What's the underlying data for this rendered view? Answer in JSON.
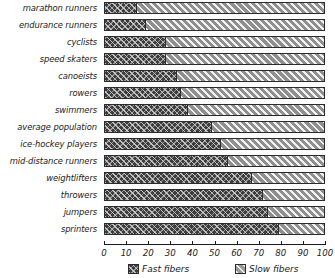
{
  "chart_data": {
    "type": "bar",
    "orientation": "horizontal",
    "stacked": true,
    "percent_stacked": true,
    "title": "",
    "xlabel": "",
    "ylabel": "",
    "xlim": [
      0,
      100
    ],
    "xticks": [
      0,
      10,
      20,
      30,
      40,
      50,
      60,
      70,
      80,
      90,
      100
    ],
    "xtick_labels": [
      "0",
      "10",
      "20",
      "30",
      "40",
      "50",
      "60",
      "70",
      "80",
      "90",
      "100"
    ],
    "grid": false,
    "legend_position": "bottom",
    "categories": [
      "marathon runners",
      "endurance runners",
      "cyclists",
      "speed skaters",
      "canoeists",
      "rowers",
      "swimmers",
      "average population",
      "ice-hockey players",
      "mid-distance runners",
      "weightlifters",
      "throwers",
      "jumpers",
      "sprinters"
    ],
    "series": [
      {
        "name": "Fast fibers",
        "values": [
          15,
          19,
          28,
          28,
          33,
          35,
          38,
          49,
          53,
          56,
          67,
          72,
          74,
          79
        ]
      },
      {
        "name": "Slow fibers",
        "values": [
          85,
          81,
          72,
          72,
          67,
          65,
          62,
          51,
          47,
          44,
          33,
          28,
          26,
          21
        ]
      }
    ],
    "legend": [
      {
        "label": "Fast fibers",
        "pattern": "dark-crosshatch",
        "color": "#3d3d3d"
      },
      {
        "label": "Slow fibers",
        "pattern": "light-diagonal-hatch",
        "color": "#8f8f8f"
      }
    ]
  }
}
